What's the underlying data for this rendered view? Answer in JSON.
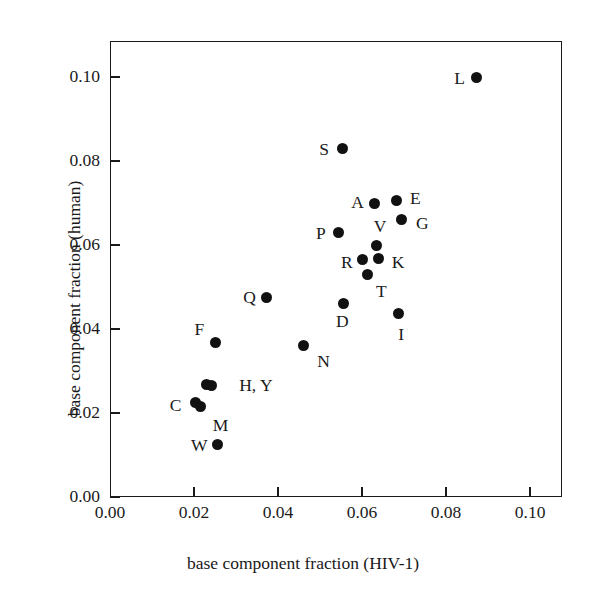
{
  "chart_data": {
    "type": "scatter",
    "title": "",
    "xlabel": "base component fraction (HIV-1)",
    "ylabel": "base component fraction (human)",
    "xlim": [
      0.0,
      0.1076
    ],
    "ylim": [
      0.0,
      0.1086
    ],
    "xticks": [
      "0.00",
      "0.02",
      "0.04",
      "0.06",
      "0.08",
      "0.10"
    ],
    "xtick_values": [
      0.0,
      0.02,
      0.04,
      0.06,
      0.08,
      0.1
    ],
    "yticks": [
      "0.00",
      "0.02",
      "0.04",
      "0.06",
      "0.08",
      "0.10"
    ],
    "ytick_values": [
      0.0,
      0.02,
      0.04,
      0.06,
      0.08,
      0.1
    ],
    "grid": false,
    "legend": false,
    "marker": "filled-circle",
    "marker_color": "#111111",
    "points": [
      {
        "label": "L",
        "x": 0.0872,
        "y": 0.0998,
        "label_dx": -22,
        "label_dy": 0
      },
      {
        "label": "S",
        "x": 0.0553,
        "y": 0.0829,
        "label_dx": -23,
        "label_dy": 0
      },
      {
        "label": "A",
        "x": 0.0629,
        "y": 0.07,
        "label_dx": -23,
        "label_dy": -1
      },
      {
        "label": "E",
        "x": 0.0681,
        "y": 0.0707,
        "label_dx": 14,
        "label_dy": -2
      },
      {
        "label": "G",
        "x": 0.0695,
        "y": 0.066,
        "label_dx": 14,
        "label_dy": 3
      },
      {
        "label": "P",
        "x": 0.0543,
        "y": 0.0629,
        "label_dx": -22,
        "label_dy": 0
      },
      {
        "label": "V",
        "x": 0.0635,
        "y": 0.0598,
        "label_dx": -3,
        "label_dy": -20
      },
      {
        "label": "R",
        "x": 0.0602,
        "y": 0.0565,
        "label_dx": -22,
        "label_dy": 2
      },
      {
        "label": "K",
        "x": 0.064,
        "y": 0.0567,
        "label_dx": 13,
        "label_dy": 3
      },
      {
        "label": "T",
        "x": 0.0614,
        "y": 0.0531,
        "label_dx": 8,
        "label_dy": 17
      },
      {
        "label": "Q",
        "x": 0.0372,
        "y": 0.0474,
        "label_dx": -23,
        "label_dy": -1
      },
      {
        "label": "D",
        "x": 0.0557,
        "y": 0.0462,
        "label_dx": -8,
        "label_dy": 18
      },
      {
        "label": "I",
        "x": 0.0686,
        "y": 0.0437,
        "label_dx": 0,
        "label_dy": 20
      },
      {
        "label": "F",
        "x": 0.0251,
        "y": 0.0367,
        "label_dx": -21,
        "label_dy": -14
      },
      {
        "label": "N",
        "x": 0.046,
        "y": 0.0362,
        "label_dx": 14,
        "label_dy": 16
      },
      {
        "label": "H",
        "x": 0.0229,
        "y": 0.0268,
        "label_dx": 33,
        "label_dy": 2
      },
      {
        "label": "Y",
        "x": 0.0241,
        "y": 0.0266,
        "label_dx": null,
        "label_dy": null
      },
      {
        "label": "C",
        "x": 0.0204,
        "y": 0.0226,
        "label_dx": -26,
        "label_dy": 3
      },
      {
        "label": "M",
        "x": 0.0216,
        "y": 0.0216,
        "label_dx": 12,
        "label_dy": 19
      },
      {
        "label": "W",
        "x": 0.0255,
        "y": 0.0125,
        "label_dx": -26,
        "label_dy": 0
      }
    ],
    "shared_labels": [
      {
        "text": "H, Y",
        "x": 0.0241,
        "y": 0.0266,
        "dx": 28,
        "dy": 0
      }
    ]
  }
}
